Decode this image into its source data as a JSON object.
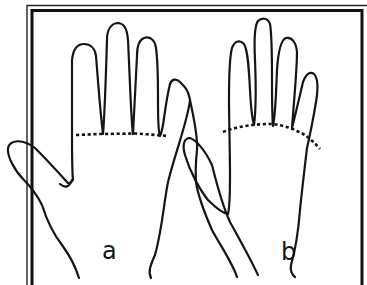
{
  "figure": {
    "panels": [
      {
        "id": "a",
        "label": "a",
        "finger_base_line": "straight"
      },
      {
        "id": "b",
        "label": "b",
        "finger_base_line": "curved"
      }
    ],
    "colors": {
      "ink": "#151515",
      "background": "#ffffff"
    }
  }
}
